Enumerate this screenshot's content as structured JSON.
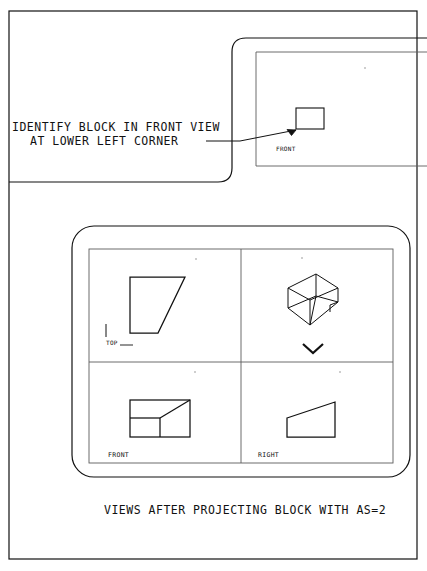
{
  "page": {
    "background_color": "#ffffff",
    "line_color": "#111111",
    "border_color": "#111111"
  },
  "annotation": {
    "line1": "IDENTIFY BLOCK IN FRONT VIEW",
    "line2": "AT LOWER LEFT CORNER",
    "leader_icon": "arrow-icon"
  },
  "top_panel": {
    "name": "front-view-detail-panel",
    "view_label": "FRONT",
    "block_icon": "rectangle-block-icon"
  },
  "main_panel": {
    "name": "four-view-projection-panel",
    "quadrants": [
      {
        "id": "top-view",
        "label": "TOP",
        "shape": "trapezoid",
        "position": "upper-left"
      },
      {
        "id": "isometric-view",
        "label": "",
        "shape": "isometric-wedge",
        "position": "upper-right",
        "marker_icon": "chevron-down-icon"
      },
      {
        "id": "front-view",
        "label": "FRONT",
        "shape": "rectangle-with-diagonal",
        "position": "lower-left"
      },
      {
        "id": "right-view",
        "label": "RIGHT",
        "shape": "right-trapezoid",
        "position": "lower-right"
      }
    ]
  },
  "caption": {
    "text": "VIEWS AFTER PROJECTING BLOCK WITH AS=2"
  }
}
